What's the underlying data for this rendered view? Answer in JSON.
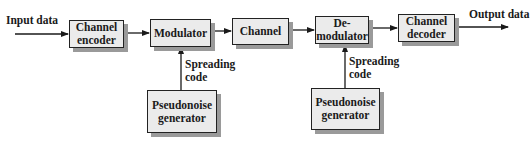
{
  "diagram": {
    "title": "",
    "colors": {
      "block_fill": "#ebebeb",
      "block_border": "#222222",
      "block_shadow": "#9a9a9a",
      "line": "#1a1a1a"
    },
    "labels": {
      "input": "Input data",
      "output": "Output data",
      "spreading_tx_1": "Spreading",
      "spreading_tx_2": "code",
      "spreading_rx_1": "Spreading",
      "spreading_rx_2": "code"
    },
    "blocks": {
      "channel_encoder": {
        "line1": "Channel",
        "line2": "encoder"
      },
      "modulator": {
        "line1": "Modulator"
      },
      "channel": {
        "line1": "Channel"
      },
      "demodulator": {
        "line1": "De-",
        "line2": "modulator"
      },
      "channel_decoder": {
        "line1": "Channel",
        "line2": "decoder"
      },
      "pn_tx": {
        "line1": "Pseudonoise",
        "line2": "generator"
      },
      "pn_rx": {
        "line1": "Pseudonoise",
        "line2": "generator"
      }
    },
    "connections": [
      {
        "from": "Input data",
        "to": "Channel encoder"
      },
      {
        "from": "Channel encoder",
        "to": "Modulator"
      },
      {
        "from": "Modulator",
        "to": "Channel"
      },
      {
        "from": "Channel",
        "to": "De-modulator"
      },
      {
        "from": "De-modulator",
        "to": "Channel decoder"
      },
      {
        "from": "Channel decoder",
        "to": "Output data"
      },
      {
        "from": "Pseudonoise generator (tx)",
        "to": "Modulator",
        "label": "Spreading code"
      },
      {
        "from": "Pseudonoise generator (rx)",
        "to": "De-modulator",
        "label": "Spreading code"
      }
    ]
  }
}
